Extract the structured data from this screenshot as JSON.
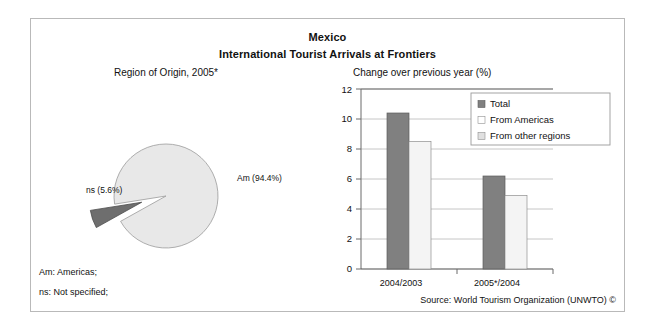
{
  "header": {
    "title": "Mexico",
    "subtitle": "International Tourist Arrivals at Frontiers"
  },
  "footnotes": {
    "am": "Am: Americas;",
    "ns": "ns: Not specified;"
  },
  "source": "Source: World Tourism Organization (UNWTO) ©",
  "pie": {
    "subtitle": "Region of Origin, 2005*",
    "label_am": "Am (94.4%)",
    "label_ns": "ns (5.6%)"
  },
  "bar": {
    "subtitle": "Change over previous year (%)"
  },
  "colors": {
    "total": "#808080",
    "from_americas": "#f2f2f2",
    "from_other_regions": "#e0e0e0",
    "pie_major": "#e8e8e8",
    "pie_minor": "#6e6e6e",
    "axis": "#4d4d4d",
    "grid": "#b0b0b0",
    "frame": "#b9b9b9"
  },
  "chart_data": [
    {
      "type": "pie",
      "title": "Region of Origin, 2005*",
      "categories": [
        "Am",
        "ns"
      ],
      "labels": [
        "Am (94.4%)",
        "ns (5.6%)"
      ],
      "values": [
        94.4,
        5.6
      ],
      "units": "%",
      "exploded": [
        "ns"
      ],
      "legend": "none",
      "notes": [
        "Am: Americas;",
        "ns: Not specified;"
      ]
    },
    {
      "type": "bar",
      "title": "Change over previous year (%)",
      "categories": [
        "2004/2003",
        "2005*/2004"
      ],
      "series": [
        {
          "name": "Total",
          "values": [
            10.4,
            6.2
          ]
        },
        {
          "name": "From Americas",
          "values": [
            8.5,
            4.9
          ]
        },
        {
          "name": "From other regions",
          "values": [
            null,
            null
          ]
        }
      ],
      "xlabel": "",
      "ylabel": "",
      "ylim": [
        0,
        12
      ],
      "yticks": [
        0,
        2,
        4,
        6,
        8,
        10,
        12
      ],
      "grid": true,
      "legend_position": "top-right"
    }
  ]
}
